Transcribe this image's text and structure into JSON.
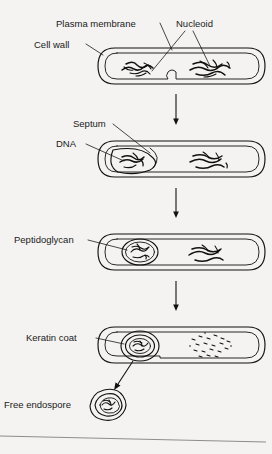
{
  "figure": {
    "background_color": "#f4f3f1",
    "ink_color": "#111111"
  },
  "labels": {
    "plasma_membrane": "Plasma membrane",
    "nucleoid": "Nucleoid",
    "cell_wall": "Cell wall",
    "septum": "Septum",
    "dna": "DNA",
    "peptidoglycan": "Peptidoglycan",
    "keratin_coat": "Keratin coat",
    "free_endospore": "Free endospore"
  },
  "stages": [
    {
      "index": 1,
      "name": "vegetative-cell-with-septum-forming",
      "labels": [
        "Plasma membrane",
        "Nucleoid",
        "Cell wall"
      ],
      "description": "Rod-shaped bacterium with double cell envelope, two nucleoid regions, septum beginning to pinch inward"
    },
    {
      "index": 2,
      "name": "septum-forms-forespore",
      "labels": [
        "Septum",
        "DNA"
      ],
      "description": "Septum encloses smaller forespore compartment containing DNA on the left"
    },
    {
      "index": 3,
      "name": "forespore-engulfed-peptidoglycan-cortex",
      "labels": [
        "Peptidoglycan"
      ],
      "description": "Forespore fully engulfed as oval body with peptidoglycan cortex; mother cell DNA at right"
    },
    {
      "index": 4,
      "name": "spore-coat-deposited-mother-cell-lysing",
      "labels": [
        "Keratin coat"
      ],
      "description": "Multi-layered keratin coat deposited around spore; mother cell DNA degrading into fragments"
    },
    {
      "index": 5,
      "name": "free-endospore-released",
      "labels": [
        "Free endospore"
      ],
      "description": "Mature endospore released from lysed mother cell"
    }
  ],
  "arrows": [
    {
      "name": "arrow-stage1-to-stage2",
      "direction": "down"
    },
    {
      "name": "arrow-stage2-to-stage3",
      "direction": "down"
    },
    {
      "name": "arrow-stage3-to-stage4",
      "direction": "down"
    },
    {
      "name": "arrow-release-endospore",
      "direction": "down-left"
    }
  ]
}
